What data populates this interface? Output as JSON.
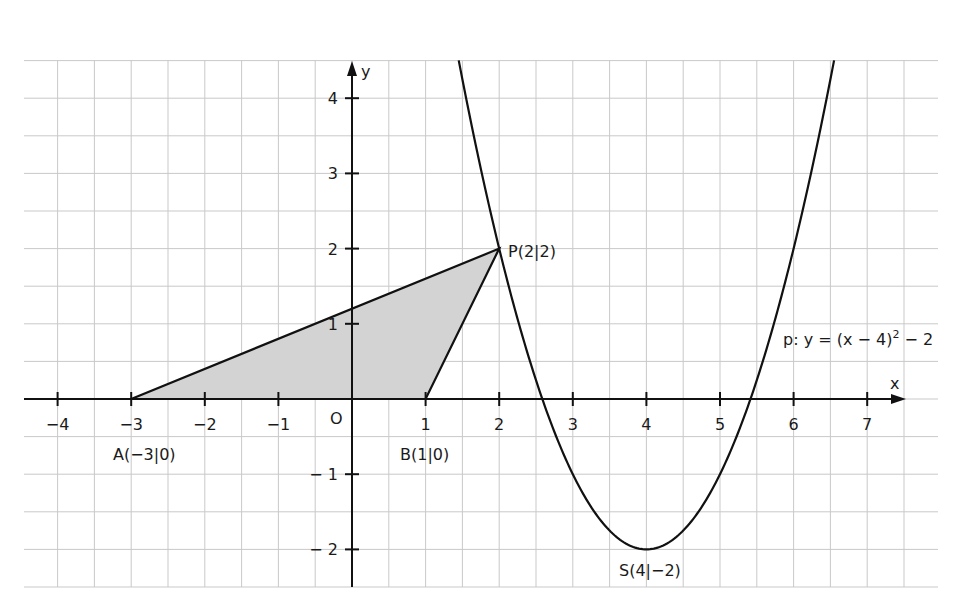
{
  "chart_data": {
    "type": "line",
    "title": "",
    "xlabel": "x",
    "ylabel": "y",
    "xlim": [
      -4.5,
      7.5
    ],
    "ylim": [
      -2.5,
      4.5
    ],
    "grid": true,
    "grid_step": 0.5,
    "x_ticks": [
      -4,
      -3,
      -2,
      -1,
      1,
      2,
      3,
      4,
      5,
      6,
      7
    ],
    "x_tick_labels": [
      "−4",
      "−3",
      "−2",
      "−1",
      "1",
      "2",
      "3",
      "4",
      "5",
      "6",
      "7"
    ],
    "y_ticks": [
      4,
      3,
      2,
      1,
      -1,
      -2
    ],
    "y_tick_labels": [
      "4",
      "3",
      "2",
      "1",
      "− 1",
      "− 2"
    ],
    "origin_label": "O",
    "series": [
      {
        "name": "p: y = (x − 4)² − 2",
        "kind": "parabola",
        "vertex": [
          4,
          -2
        ],
        "a": 1,
        "x_range": [
          1.45,
          6.55
        ]
      },
      {
        "name": "triangle ABP",
        "kind": "polygon",
        "filled": true,
        "points": [
          [
            -3,
            0
          ],
          [
            1,
            0
          ],
          [
            2,
            2
          ]
        ]
      }
    ],
    "points": [
      {
        "name": "A",
        "x": -3,
        "y": 0,
        "label": "A(−3|0)"
      },
      {
        "name": "B",
        "x": 1,
        "y": 0,
        "label": "B(1|0)"
      },
      {
        "name": "P",
        "x": 2,
        "y": 2,
        "label": "P(2|2)"
      },
      {
        "name": "S",
        "x": 4,
        "y": -2,
        "label": "S(4|−2)"
      }
    ],
    "annotations": [
      {
        "text": "p: y = (x − 4)² − 2",
        "x": 5.85,
        "y": 0.75
      }
    ]
  },
  "labels": {
    "x_axis": "x",
    "y_axis": "y",
    "origin": "O",
    "A": "A(−3|0)",
    "B": "B(1|0)",
    "P": "P(2|2)",
    "S": "S(4|−2)",
    "equation_main": "p: y = (x − 4)",
    "equation_exp": "2",
    "equation_tail": " − 2"
  },
  "colors": {
    "grid": "#c9c9c9",
    "axis": "#111111",
    "curve": "#111111",
    "fill": "#d3d3d3",
    "background": "#ffffff"
  }
}
